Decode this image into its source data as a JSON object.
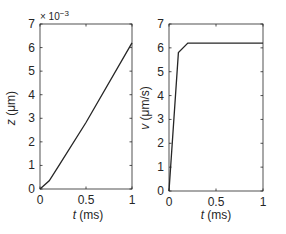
{
  "chart_data": [
    {
      "type": "line",
      "title": "",
      "xlabel": "t (ms)",
      "ylabel": "z (μm)",
      "exponent_label": "× 10^-3",
      "xlim": [
        0,
        1
      ],
      "ylim": [
        0,
        7
      ],
      "xticks": [
        "0",
        "0.5",
        "1"
      ],
      "yticks": [
        "0",
        "1",
        "2",
        "3",
        "4",
        "5",
        "6",
        "7"
      ],
      "grid": false,
      "series": [
        {
          "name": "z",
          "x": [
            0,
            0.1,
            0.2,
            0.5,
            1.0
          ],
          "y": [
            0,
            0.35,
            0.96,
            2.82,
            6.2
          ]
        }
      ]
    },
    {
      "type": "line",
      "title": "",
      "xlabel": "t (ms)",
      "ylabel": "v (μm/s)",
      "xlim": [
        0,
        1
      ],
      "ylim": [
        0,
        7
      ],
      "xticks": [
        "0",
        "0.5",
        "1"
      ],
      "yticks": [
        "0",
        "1",
        "2",
        "3",
        "4",
        "5",
        "6",
        "7"
      ],
      "grid": false,
      "series": [
        {
          "name": "v",
          "x": [
            0,
            0.1,
            0.2,
            0.5,
            1.0
          ],
          "y": [
            0,
            5.8,
            6.2,
            6.2,
            6.2
          ]
        }
      ]
    }
  ],
  "labels": {
    "left_xlabel_var": "t",
    "left_xlabel_unit": " (ms)",
    "left_ylabel_var": "z",
    "left_ylabel_unit": " (μm)",
    "left_exp_base": "× 10",
    "left_exp_power": "−3",
    "right_xlabel_var": "t",
    "right_xlabel_unit": " (ms)",
    "right_ylabel_var": "v",
    "right_ylabel_unit": " (μm/s)"
  }
}
